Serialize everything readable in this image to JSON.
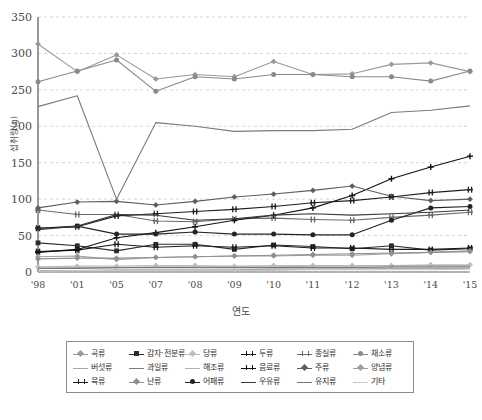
{
  "chart_data": {
    "type": "line",
    "title": "",
    "xlabel": "연도",
    "ylabel": "섭취량(g)",
    "ylim": [
      0,
      350
    ],
    "ytick_step": 50,
    "yticks": [
      "0",
      "50",
      "100",
      "150",
      "200",
      "250",
      "300",
      "350"
    ],
    "grid": true,
    "grid_style": "dashed-horizontal",
    "legend_position": "bottom",
    "legend_columns": 6,
    "legend_rows": 3,
    "categories": [
      "'98",
      "'01",
      "'05",
      "'07",
      "'08",
      "'09",
      "'10",
      "'11",
      "'12",
      "'13",
      "'14",
      "'15"
    ],
    "series": [
      {
        "name": "곡류",
        "color": "#9a9a9a",
        "marker": "diamond",
        "values": [
          313,
          275,
          298,
          265,
          271,
          268,
          289,
          271,
          272,
          285,
          287,
          275
        ]
      },
      {
        "name": "감자·전분류",
        "color": "#2b2b2b",
        "marker": "square",
        "values": [
          40,
          36,
          29,
          38,
          38,
          31,
          37,
          35,
          32,
          36,
          30,
          32
        ]
      },
      {
        "name": "당류",
        "color": "#bdbdbd",
        "marker": "diamond",
        "values": [
          7,
          8,
          8,
          9,
          9,
          8,
          9,
          9,
          9,
          9,
          10,
          10
        ]
      },
      {
        "name": "두류",
        "color": "#1a1a1a",
        "marker": "cross",
        "values": [
          28,
          30,
          38,
          34,
          36,
          34,
          36,
          33,
          33,
          31,
          31,
          33
        ]
      },
      {
        "name": "종실류",
        "color": "#6b6b6b",
        "marker": "cross",
        "values": [
          85,
          79,
          79,
          70,
          69,
          73,
          74,
          72,
          71,
          75,
          78,
          82
        ]
      },
      {
        "name": "채소류",
        "color": "#8a8a8a",
        "marker": "circle",
        "values": [
          261,
          276,
          291,
          248,
          268,
          265,
          271,
          271,
          268,
          268,
          262,
          276
        ]
      },
      {
        "name": "버섯류",
        "color": "#a5a5a5",
        "marker": "none",
        "values": [
          2,
          2,
          3,
          3,
          3,
          3,
          4,
          4,
          4,
          5,
          5,
          5
        ]
      },
      {
        "name": "과일류",
        "color": "#7a7a7a",
        "marker": "none",
        "values": [
          227,
          242,
          100,
          205,
          200,
          193,
          194,
          194,
          196,
          219,
          222,
          228
        ]
      },
      {
        "name": "해조류",
        "color": "#b0b0b0",
        "marker": "none",
        "values": [
          5,
          6,
          6,
          7,
          7,
          7,
          7,
          8,
          8,
          9,
          9,
          9
        ]
      },
      {
        "name": "음료류",
        "color": "#121212",
        "marker": "plus",
        "values": [
          27,
          31,
          47,
          54,
          62,
          71,
          78,
          88,
          105,
          128,
          144,
          159
        ]
      },
      {
        "name": "주류",
        "color": "#5e5e5e",
        "marker": "diamond",
        "values": [
          88,
          96,
          97,
          92,
          97,
          103,
          107,
          112,
          118,
          104,
          98,
          100
        ]
      },
      {
        "name": "양념류",
        "color": "#9e9e9e",
        "marker": "diamond",
        "values": [
          21,
          22,
          17,
          20,
          21,
          22,
          22,
          23,
          23,
          25,
          27,
          29
        ]
      },
      {
        "name": "육류",
        "color": "#1f1f1f",
        "marker": "cross",
        "values": [
          60,
          62,
          77,
          80,
          83,
          86,
          90,
          95,
          98,
          103,
          109,
          113
        ]
      },
      {
        "name": "난류",
        "color": "#8f8f8f",
        "marker": "diamond",
        "values": [
          18,
          19,
          19,
          20,
          21,
          22,
          23,
          24,
          25,
          26,
          27,
          28
        ]
      },
      {
        "name": "어패류",
        "color": "#242424",
        "marker": "circle",
        "values": [
          60,
          63,
          52,
          52,
          55,
          52,
          52,
          51,
          51,
          71,
          88,
          90
        ]
      },
      {
        "name": "우유류",
        "color": "#3a3a3a",
        "marker": "none",
        "values": [
          58,
          63,
          79,
          78,
          71,
          73,
          78,
          80,
          78,
          80,
          82,
          85
        ]
      },
      {
        "name": "유지류",
        "color": "#787878",
        "marker": "none",
        "values": [
          5,
          5,
          6,
          6,
          6,
          6,
          6,
          6,
          6,
          7,
          7,
          7
        ]
      },
      {
        "name": "기타",
        "color": "#c8c8c8",
        "marker": "none",
        "values": [
          1,
          2,
          2,
          2,
          2,
          2,
          2,
          3,
          3,
          3,
          3,
          4
        ]
      }
    ]
  }
}
